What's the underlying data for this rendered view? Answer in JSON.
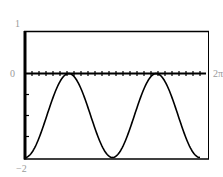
{
  "chart_data": {
    "type": "line",
    "title": "",
    "xlabel": "",
    "ylabel": "",
    "function": "y = -1 - cos(2x)",
    "xlim": [
      0,
      6.2832
    ],
    "ylim": [
      -2,
      1
    ],
    "x_tick_labels": [
      "2π"
    ],
    "y_tick_labels": [
      "1",
      "0",
      "-2"
    ],
    "grid": false,
    "axis_line_y": 0,
    "series": [
      {
        "name": "curve",
        "x": [
          0,
          0.3927,
          0.7854,
          1.1781,
          1.5708,
          1.9635,
          2.3562,
          2.7489,
          3.1416,
          3.5343,
          3.927,
          4.3197,
          4.7124,
          5.1051,
          5.4978,
          5.8905,
          6.2832
        ],
        "values": [
          -2,
          -1.71,
          -1,
          -0.29,
          0,
          -0.29,
          -1,
          -1.71,
          -2,
          -1.71,
          -1,
          -0.29,
          0,
          -0.29,
          -1,
          -1.71,
          -2
        ]
      }
    ]
  },
  "labels": {
    "y_top": "1",
    "y_zero": "0",
    "y_bottom": "−2",
    "x_right": "2π"
  },
  "colors": {
    "frame": "#000000",
    "curve": "#000000",
    "label": "#9a9a9a",
    "background": "#ffffff"
  }
}
